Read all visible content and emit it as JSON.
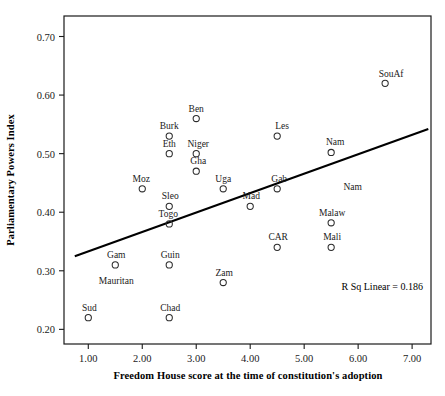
{
  "chart_data": {
    "type": "scatter",
    "title": "",
    "xlabel": "Freedom House score at the time of constitution's adoption",
    "ylabel": "Parliamentary Powers Index",
    "xlim": [
      0.55,
      7.35
    ],
    "ylim": [
      0.175,
      0.735
    ],
    "xticks": [
      "1.00",
      "2.00",
      "3.00",
      "4.00",
      "5.00",
      "6.00",
      "7.00"
    ],
    "xtick_values": [
      1,
      2,
      3,
      4,
      5,
      6,
      7
    ],
    "yticks": [
      "0.20",
      "0.30",
      "0.40",
      "0.50",
      "0.60",
      "0.70"
    ],
    "ytick_values": [
      0.2,
      0.3,
      0.4,
      0.5,
      0.6,
      0.7
    ],
    "grid": false,
    "legend": null,
    "marker": "open-circle",
    "annotation": "R Sq Linear = 0.186",
    "r_squared": 0.186,
    "fit_line": {
      "type": "linear",
      "x_start": 0.75,
      "y_start": 0.325,
      "x_end": 7.3,
      "y_end": 0.542
    },
    "points": [
      {
        "label": "SouAf",
        "x": 6.5,
        "y": 0.62,
        "label_dx": 6,
        "label_dy": -6
      },
      {
        "label": "Ben",
        "x": 3.0,
        "y": 0.56,
        "label_dx": 0,
        "label_dy": -7
      },
      {
        "label": "Burk",
        "x": 2.5,
        "y": 0.53,
        "label_dx": 0,
        "label_dy": -7
      },
      {
        "label": "Les",
        "x": 4.5,
        "y": 0.53,
        "label_dx": 5,
        "label_dy": -7
      },
      {
        "label": "Eth",
        "x": 2.5,
        "y": 0.5,
        "label_dx": 0,
        "label_dy": -7
      },
      {
        "label": "Niger",
        "x": 3.0,
        "y": 0.5,
        "label_dx": 2,
        "label_dy": -7
      },
      {
        "label": "Nam",
        "x": 5.5,
        "y": 0.502,
        "label_dx": 4,
        "label_dy": -7
      },
      {
        "label": "Gha",
        "x": 3.0,
        "y": 0.47,
        "label_dx": 2,
        "label_dy": -7
      },
      {
        "label": "Uga",
        "x": 3.5,
        "y": 0.44,
        "label_dx": 0,
        "label_dy": -7
      },
      {
        "label": "Gab",
        "x": 4.5,
        "y": 0.44,
        "label_dx": 2,
        "label_dy": -7
      },
      {
        "label": "Moz",
        "x": 2.0,
        "y": 0.44,
        "label_dx": -1,
        "label_dy": -7
      },
      {
        "label": "Nam",
        "x": 5.9,
        "y": 0.438,
        "label_dx": 0,
        "label_dy": 0,
        "marker": false
      },
      {
        "label": "Sleo",
        "x": 2.5,
        "y": 0.41,
        "label_dx": 1,
        "label_dy": -7
      },
      {
        "label": "Mad",
        "x": 4.0,
        "y": 0.41,
        "label_dx": 1,
        "label_dy": -7
      },
      {
        "label": "Togo",
        "x": 2.5,
        "y": 0.38,
        "label_dx": -1,
        "label_dy": -7
      },
      {
        "label": "Malaw",
        "x": 5.5,
        "y": 0.382,
        "label_dx": 1,
        "label_dy": -7
      },
      {
        "label": "CAR",
        "x": 4.5,
        "y": 0.34,
        "label_dx": 1,
        "label_dy": -7
      },
      {
        "label": "Mali",
        "x": 5.5,
        "y": 0.34,
        "label_dx": 1,
        "label_dy": -7
      },
      {
        "label": "Gam",
        "x": 1.5,
        "y": 0.31,
        "label_dx": 1,
        "label_dy": -7
      },
      {
        "label": "Guin",
        "x": 2.5,
        "y": 0.31,
        "label_dx": 1,
        "label_dy": -7
      },
      {
        "label": "Mauritan",
        "x": 1.5,
        "y": 0.295,
        "label_dx": 1,
        "label_dy": 10,
        "marker": false
      },
      {
        "label": "Zam",
        "x": 3.5,
        "y": 0.28,
        "label_dx": 1,
        "label_dy": -7
      },
      {
        "label": "Sud",
        "x": 1.0,
        "y": 0.22,
        "label_dx": 1,
        "label_dy": -7
      },
      {
        "label": "Chad",
        "x": 2.5,
        "y": 0.22,
        "label_dx": 1,
        "label_dy": -7
      }
    ]
  },
  "colors": {
    "axis": "#1a1a1a",
    "marker_stroke": "#2a2a2a",
    "fit_line": "#000000",
    "text": "#1a1a1a",
    "background": "#ffffff"
  }
}
